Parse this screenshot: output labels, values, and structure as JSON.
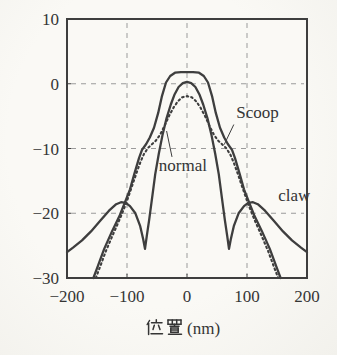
{
  "figure": {
    "background": "#f7f6f2",
    "plot_background": "#faf9f5",
    "ink": "#3e3e3e",
    "grid_color": "#9b9b9b",
    "text_color": "#353535"
  },
  "chart_data": {
    "type": "line",
    "title": "",
    "xlabel": "位置 (nm)",
    "ylabel": "",
    "xlim": [
      -200,
      200
    ],
    "ylim": [
      -30,
      10
    ],
    "xticks": [
      "−200",
      "−100",
      "0",
      "100",
      "200"
    ],
    "xtick_values": [
      -200,
      -100,
      0,
      100,
      200
    ],
    "yticks": [
      "10",
      "0",
      "−10",
      "−20",
      "−30"
    ],
    "ytick_values": [
      10,
      0,
      -10,
      -20,
      -30
    ],
    "grid": "dashed",
    "grid_x": [
      -100,
      0,
      100
    ],
    "grid_y": [
      0,
      -10,
      -20
    ],
    "legend_position": "inline-annotations",
    "series": [
      {
        "name": "Scoop",
        "line_style": "solid",
        "points": [
          [
            -156,
            -30
          ],
          [
            -150,
            -28.5
          ],
          [
            -138,
            -25.5
          ],
          [
            -125,
            -22.8
          ],
          [
            -112,
            -20.3
          ],
          [
            -103,
            -18.2
          ],
          [
            -95,
            -16.3
          ],
          [
            -88,
            -14
          ],
          [
            -80,
            -11.5
          ],
          [
            -75,
            -10.2
          ],
          [
            -68,
            -9.3
          ],
          [
            -62,
            -8.3
          ],
          [
            -55,
            -6.8
          ],
          [
            -48,
            -4.5
          ],
          [
            -42,
            -2
          ],
          [
            -35,
            0.2
          ],
          [
            -28,
            1.2
          ],
          [
            -20,
            1.7
          ],
          [
            -10,
            1.8
          ],
          [
            0,
            1.8
          ],
          [
            10,
            1.8
          ],
          [
            20,
            1.7
          ],
          [
            28,
            1.2
          ],
          [
            35,
            0.2
          ],
          [
            42,
            -2
          ],
          [
            48,
            -4.5
          ],
          [
            55,
            -6.8
          ],
          [
            62,
            -8.3
          ],
          [
            68,
            -9.3
          ],
          [
            75,
            -10.2
          ],
          [
            80,
            -11.5
          ],
          [
            88,
            -14
          ],
          [
            95,
            -16.3
          ],
          [
            103,
            -18.2
          ],
          [
            112,
            -20.3
          ],
          [
            125,
            -22.8
          ],
          [
            138,
            -25.5
          ],
          [
            150,
            -28.5
          ],
          [
            156,
            -30
          ]
        ]
      },
      {
        "name": "normal",
        "line_style": "dotted",
        "points": [
          [
            -152,
            -30
          ],
          [
            -145,
            -28.3
          ],
          [
            -135,
            -25.8
          ],
          [
            -123,
            -23.2
          ],
          [
            -112,
            -20.9
          ],
          [
            -102,
            -18.6
          ],
          [
            -93,
            -16.2
          ],
          [
            -85,
            -14
          ],
          [
            -78,
            -12.2
          ],
          [
            -72,
            -10.9
          ],
          [
            -65,
            -9.9
          ],
          [
            -58,
            -9.3
          ],
          [
            -52,
            -8.8
          ],
          [
            -45,
            -7.9
          ],
          [
            -38,
            -6.6
          ],
          [
            -30,
            -5
          ],
          [
            -22,
            -3.6
          ],
          [
            -15,
            -2.7
          ],
          [
            -8,
            -2.1
          ],
          [
            0,
            -1.9
          ],
          [
            8,
            -2.1
          ],
          [
            15,
            -2.7
          ],
          [
            22,
            -3.6
          ],
          [
            30,
            -5
          ],
          [
            38,
            -6.6
          ],
          [
            45,
            -7.9
          ],
          [
            52,
            -8.8
          ],
          [
            58,
            -9.3
          ],
          [
            65,
            -9.9
          ],
          [
            72,
            -10.9
          ],
          [
            78,
            -12.2
          ],
          [
            85,
            -14
          ],
          [
            93,
            -16.2
          ],
          [
            102,
            -18.6
          ],
          [
            112,
            -20.9
          ],
          [
            123,
            -23.2
          ],
          [
            135,
            -25.8
          ],
          [
            145,
            -28.3
          ],
          [
            152,
            -30
          ]
        ]
      },
      {
        "name": "claw",
        "line_style": "solid",
        "points": [
          [
            -200,
            -26
          ],
          [
            -190,
            -25.3
          ],
          [
            -175,
            -24.2
          ],
          [
            -160,
            -22.8
          ],
          [
            -145,
            -21.2
          ],
          [
            -130,
            -19.6
          ],
          [
            -118,
            -18.6
          ],
          [
            -110,
            -18.3
          ],
          [
            -102,
            -18.4
          ],
          [
            -95,
            -18.9
          ],
          [
            -86,
            -20
          ],
          [
            -78,
            -22
          ],
          [
            -73,
            -24
          ],
          [
            -70,
            -25.5
          ],
          [
            -67,
            -23.5
          ],
          [
            -63,
            -21
          ],
          [
            -58,
            -17.5
          ],
          [
            -53,
            -14
          ],
          [
            -47,
            -10.8
          ],
          [
            -41,
            -8
          ],
          [
            -34,
            -5.3
          ],
          [
            -27,
            -3.2
          ],
          [
            -21,
            -1.7
          ],
          [
            -14,
            -0.5
          ],
          [
            -7,
            0.1
          ],
          [
            0,
            0.3
          ],
          [
            7,
            0.1
          ],
          [
            14,
            -0.5
          ],
          [
            21,
            -1.7
          ],
          [
            27,
            -3.2
          ],
          [
            34,
            -5.3
          ],
          [
            41,
            -8
          ],
          [
            47,
            -10.8
          ],
          [
            53,
            -14
          ],
          [
            58,
            -17.5
          ],
          [
            63,
            -21
          ],
          [
            67,
            -23.5
          ],
          [
            70,
            -25.5
          ],
          [
            73,
            -24
          ],
          [
            78,
            -22
          ],
          [
            86,
            -20
          ],
          [
            95,
            -18.9
          ],
          [
            102,
            -18.4
          ],
          [
            110,
            -18.3
          ],
          [
            118,
            -18.6
          ],
          [
            130,
            -19.6
          ],
          [
            145,
            -21.2
          ],
          [
            160,
            -22.8
          ],
          [
            175,
            -24.2
          ],
          [
            190,
            -25.3
          ],
          [
            200,
            -26
          ]
        ]
      }
    ],
    "annotations": [
      {
        "text": "Scoop",
        "x": 82,
        "y": -5.3,
        "anchor": "start",
        "leader": [
          [
            78,
            -6.3
          ],
          [
            62,
            -9.4
          ]
        ]
      },
      {
        "text": "normal",
        "x": -47,
        "y": -13.5,
        "anchor": "start",
        "leader": [
          [
            -25,
            -11.3
          ],
          [
            -34,
            -7.3
          ]
        ]
      },
      {
        "text": "claw",
        "x": 152,
        "y": -18.1,
        "anchor": "start",
        "leader": null
      }
    ]
  }
}
